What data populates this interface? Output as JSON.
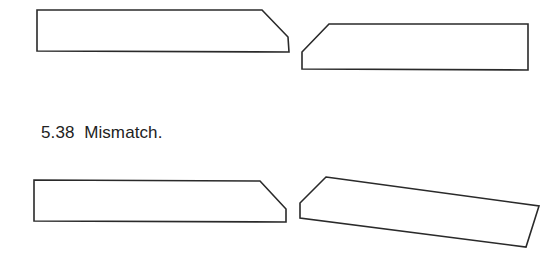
{
  "figure": {
    "caption": "5.38  Mismatch.",
    "figure_number": "5.38",
    "caption_text": "Mismatch.",
    "stroke_color": "#2a2a2a",
    "background_color": "#ffffff"
  },
  "diagram": {
    "rows": [
      {
        "name": "matched-pair",
        "description": "Two beveled boards whose angled ends align",
        "pieces": [
          "left-board-bevel-right",
          "right-board-bevel-left"
        ]
      },
      {
        "name": "mismatched-pair",
        "description": "Two beveled boards where the right board is skewed, creating a mismatch",
        "pieces": [
          "left-board-bevel-right",
          "right-board-bevel-left-skewed"
        ]
      }
    ]
  }
}
